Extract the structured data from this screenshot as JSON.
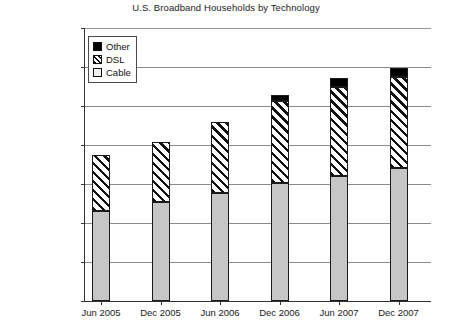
{
  "chart_data": {
    "type": "bar",
    "subtype": "stacked-column",
    "title": "U.S. Broadband Households by Technology",
    "xlabel": "",
    "ylabel": "",
    "categories": [
      "Jun 2005",
      "Dec 2005",
      "Jun 2006",
      "Dec 2006",
      "Jun 2007",
      "Dec 2007"
    ],
    "series": [
      {
        "name": "Cable",
        "values": [
          23000000,
          25400000,
          27700000,
          30200000,
          32000000,
          34100000
        ]
      },
      {
        "name": "DSL",
        "values": [
          14400000,
          15300000,
          18100000,
          21200000,
          22800000,
          23300000
        ]
      },
      {
        "name": "Other",
        "values": [
          0,
          0,
          0,
          1300000,
          2300000,
          2300000
        ]
      }
    ],
    "totals": [
      37400000,
      40700000,
      45800000,
      51500000,
      55100000,
      59700000
    ],
    "ylim": [
      0,
      70000000
    ],
    "ytick_values": [
      0,
      10000000,
      20000000,
      30000000,
      40000000,
      50000000,
      60000000,
      70000000
    ],
    "ytick_labels": [
      "0",
      "10,000,000",
      "20,000,000",
      "30,000,000",
      "40,000,000",
      "50,000,000",
      "60,000,000",
      "70,000,000"
    ],
    "grid": true,
    "legend_position": "top-left-inside",
    "colors": {
      "cable": "#c6c6c6",
      "dsl": "#ffffff",
      "other": "#000000",
      "axis": "#333333",
      "grid": "#8c8c8c",
      "text": "#1a1a1a"
    }
  },
  "legend": {
    "items": [
      {
        "label": "Other",
        "pattern": "solid-black"
      },
      {
        "label": "DSL",
        "pattern": "diagonal-hatch"
      },
      {
        "label": "Cable",
        "pattern": "light-gray"
      }
    ]
  }
}
